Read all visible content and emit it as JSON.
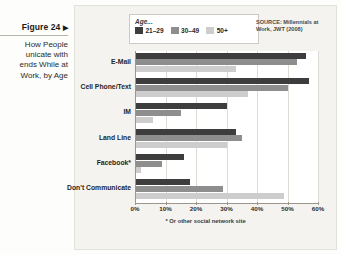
{
  "caption": {
    "figure_label": "Figure 24",
    "arrow": "▶",
    "title_lines": [
      "How People",
      "unicate with",
      "ends While at",
      "Work, by Age"
    ]
  },
  "legend": {
    "title": "Age...",
    "items": [
      {
        "label": "21–29",
        "color": "#3d3d3d"
      },
      {
        "label": "30–49",
        "color": "#8e8e8e"
      },
      {
        "label": "50+",
        "color": "#cdcdcd"
      }
    ]
  },
  "source_note": "SOURCE: Millennials at Work, JWT (2008)",
  "footnote": "* Or other social network site",
  "chart_data": {
    "type": "bar",
    "orientation": "horizontal",
    "xlabel": "",
    "ylabel": "",
    "xlim": [
      0,
      60
    ],
    "grid": true,
    "legend_position": "top-left",
    "categories": [
      "E-Mail",
      "Cell Phone/Text",
      "IM",
      "Land Line",
      "Facebook*",
      "Don't Communicate"
    ],
    "tick_labels": [
      "0%",
      "10%",
      "20%",
      "30%",
      "40%",
      "50%",
      "60%"
    ],
    "tick_values": [
      0,
      10,
      20,
      30,
      40,
      50,
      60
    ],
    "series": [
      {
        "name": "21–29",
        "color": "#3d3d3d",
        "values": [
          56,
          57,
          30,
          33,
          16,
          18
        ]
      },
      {
        "name": "30–49",
        "color": "#8e8e8e",
        "values": [
          53,
          50,
          15,
          35,
          9,
          29
        ]
      },
      {
        "name": "50+",
        "color": "#cdcdcd",
        "values": [
          33,
          37,
          6,
          30,
          2,
          49
        ]
      }
    ]
  }
}
